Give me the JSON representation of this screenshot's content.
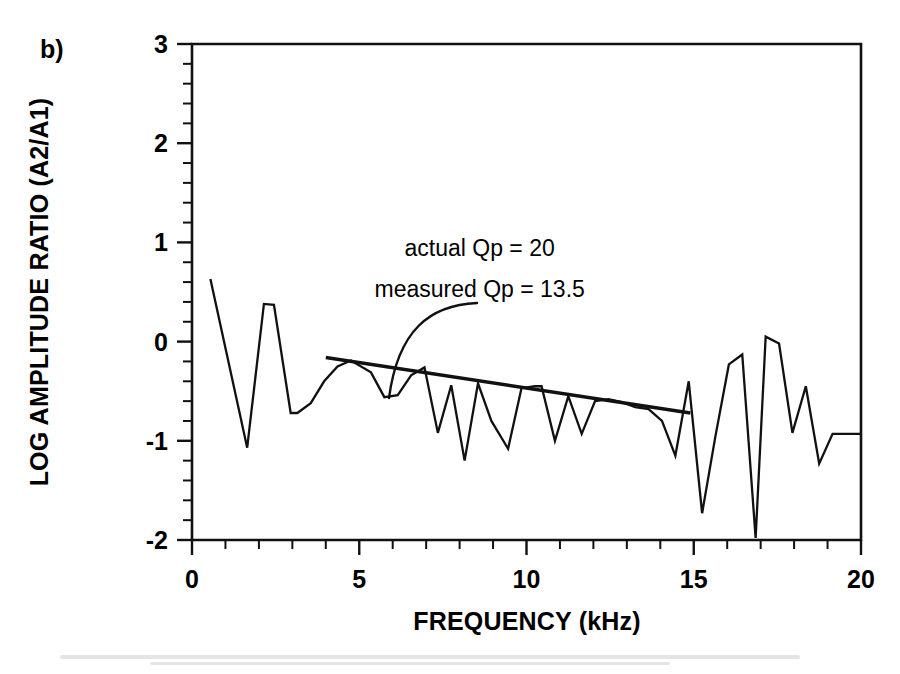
{
  "panel": {
    "label": "b)"
  },
  "chart_data": {
    "type": "line",
    "title": "",
    "subtitle": "",
    "xlabel": "FREQUENCY (kHz)",
    "ylabel": "LOG AMPLITUDE RATIO (A2/A1)",
    "xlim": [
      0,
      20
    ],
    "ylim": [
      -2,
      3
    ],
    "x_major_ticks": [
      0,
      5,
      10,
      15,
      20
    ],
    "x_major_tick_labels": [
      "0",
      "5",
      "10",
      "15",
      "20"
    ],
    "x_minor_tick_step": 1,
    "y_major_ticks": [
      3,
      2,
      1,
      0,
      -1,
      -2
    ],
    "y_major_tick_labels": [
      "3",
      "2",
      "1",
      "0",
      "-1",
      "-2"
    ],
    "y_minor_tick_step": 0.2,
    "grid": false,
    "legend": null,
    "series": [
      {
        "name": "spectral ratio",
        "kind": "line",
        "x": [
          0.55,
          1.65,
          2.15,
          2.45,
          2.95,
          3.15,
          3.55,
          3.95,
          4.35,
          4.75,
          5.35,
          5.75,
          6.15,
          6.55,
          6.95,
          7.35,
          7.75,
          8.15,
          8.55,
          8.95,
          9.45,
          9.85,
          10.25,
          10.45,
          10.85,
          11.25,
          11.65,
          12.05,
          12.45,
          12.85,
          13.25,
          13.65,
          14.05,
          14.45,
          14.85,
          15.25,
          15.65,
          16.05,
          16.45,
          16.85,
          17.15,
          17.55,
          17.95,
          18.35,
          18.75,
          19.15,
          19.55,
          20.0
        ],
        "y": [
          0.63,
          -1.07,
          0.38,
          0.37,
          -0.72,
          -0.72,
          -0.62,
          -0.4,
          -0.25,
          -0.19,
          -0.31,
          -0.56,
          -0.54,
          -0.34,
          -0.26,
          -0.92,
          -0.44,
          -1.2,
          -0.42,
          -0.8,
          -1.08,
          -0.47,
          -0.45,
          -0.45,
          -1.0,
          -0.55,
          -0.93,
          -0.6,
          -0.58,
          -0.61,
          -0.66,
          -0.68,
          -0.8,
          -1.15,
          -0.4,
          -1.73,
          -0.95,
          -0.23,
          -0.13,
          -1.98,
          0.05,
          -0.02,
          -0.92,
          -0.45,
          -1.23,
          -0.93,
          -0.93,
          -0.93
        ]
      },
      {
        "name": "measured Qp fit",
        "kind": "trendline",
        "x": [
          4.0,
          14.9
        ],
        "y": [
          -0.16,
          -0.72
        ]
      }
    ],
    "annotations": [
      {
        "id": "actual-qp",
        "text": "actual Qp = 20",
        "x": 8.6,
        "y": 0.86
      },
      {
        "id": "measured-qp",
        "text": "measured Qp = 13.5",
        "x": 8.6,
        "y": 0.45,
        "leader": true
      }
    ]
  }
}
